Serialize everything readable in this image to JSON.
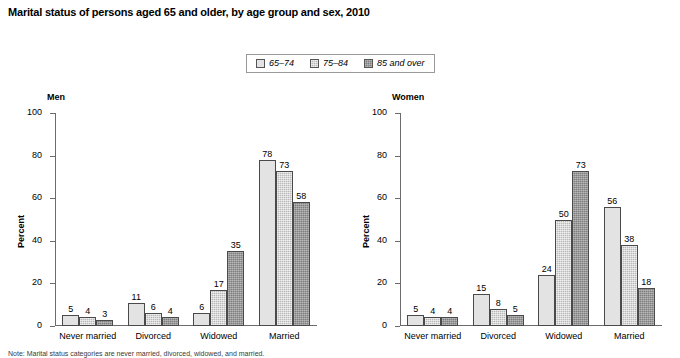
{
  "title": "Marital status of persons aged 65 and older, by age group and sex, 2010",
  "legend": {
    "items": [
      {
        "label": "65–74",
        "color": "#e3e3e3"
      },
      {
        "label": "75–84",
        "color": "#b9b9b9"
      },
      {
        "label": "85 and over",
        "color": "#7e7e7e"
      }
    ]
  },
  "footnote": "Note: Marital status categories are never married, divorced, widowed, and married.",
  "chart_data": [
    {
      "type": "bar",
      "title": "Men",
      "xlabel": "",
      "ylabel": "Percent",
      "ylim": [
        0,
        100
      ],
      "yticks": [
        0,
        20,
        40,
        60,
        80,
        100
      ],
      "grid": false,
      "legend_position": "top-center",
      "categories": [
        "Never married",
        "Divorced",
        "Widowed",
        "Married"
      ],
      "series": [
        {
          "name": "65–74",
          "values": [
            5,
            11,
            6,
            78
          ]
        },
        {
          "name": "75–84",
          "values": [
            4,
            6,
            17,
            73
          ]
        },
        {
          "name": "85 and over",
          "values": [
            3,
            4,
            35,
            58
          ]
        }
      ]
    },
    {
      "type": "bar",
      "title": "Women",
      "xlabel": "",
      "ylabel": "Percent",
      "ylim": [
        0,
        100
      ],
      "yticks": [
        0,
        20,
        40,
        60,
        80,
        100
      ],
      "grid": false,
      "legend_position": "top-center",
      "categories": [
        "Never married",
        "Divorced",
        "Widowed",
        "Married"
      ],
      "series": [
        {
          "name": "65–74",
          "values": [
            5,
            15,
            24,
            56
          ]
        },
        {
          "name": "75–84",
          "values": [
            4,
            8,
            50,
            38
          ]
        },
        {
          "name": "85 and over",
          "values": [
            4,
            5,
            73,
            18
          ]
        }
      ]
    }
  ]
}
